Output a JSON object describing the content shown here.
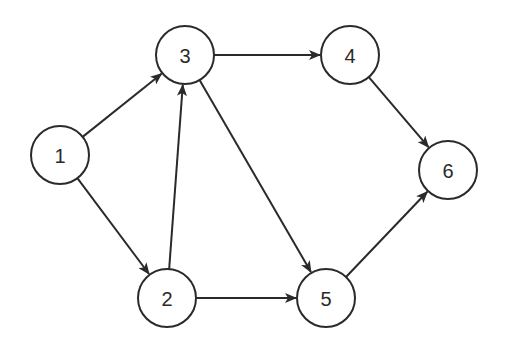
{
  "graph": {
    "directed": true,
    "nodes": [
      {
        "id": "1",
        "label": "1",
        "x": 60,
        "y": 155
      },
      {
        "id": "2",
        "label": "2",
        "x": 167,
        "y": 298
      },
      {
        "id": "3",
        "label": "3",
        "x": 185,
        "y": 55
      },
      {
        "id": "4",
        "label": "4",
        "x": 350,
        "y": 55
      },
      {
        "id": "5",
        "label": "5",
        "x": 326,
        "y": 298
      },
      {
        "id": "6",
        "label": "6",
        "x": 448,
        "y": 170
      }
    ],
    "edges": [
      {
        "from": "1",
        "to": "3"
      },
      {
        "from": "1",
        "to": "2"
      },
      {
        "from": "2",
        "to": "3"
      },
      {
        "from": "2",
        "to": "5"
      },
      {
        "from": "3",
        "to": "4"
      },
      {
        "from": "3",
        "to": "5"
      },
      {
        "from": "4",
        "to": "6"
      },
      {
        "from": "5",
        "to": "6"
      }
    ],
    "node_radius": 29,
    "stroke_color": "#2a2a2a",
    "fill_color": "#ffffff"
  }
}
